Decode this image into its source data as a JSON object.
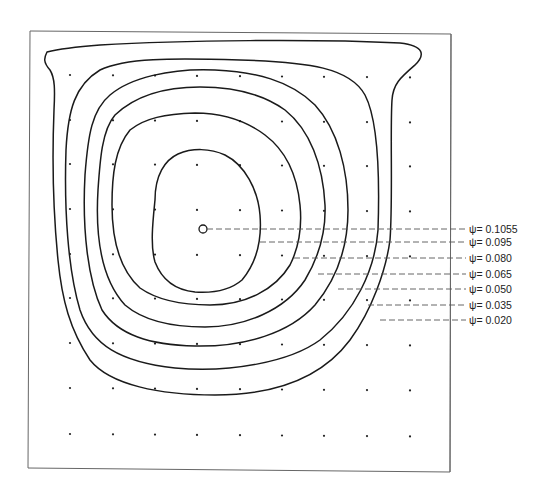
{
  "figure": {
    "type": "streamline contour plot",
    "stroke_color": "#1a1a1a",
    "frame_color": "#555555",
    "background": "#ffffff"
  },
  "center_marker": {
    "x": 203,
    "y": 229,
    "r": 4,
    "label": "vortex center"
  },
  "grid_dots": {
    "columns": [
      70,
      113,
      155,
      197,
      240,
      282,
      324,
      367,
      410
    ],
    "rows": [
      75,
      120,
      164,
      209,
      254,
      298,
      343,
      388,
      434
    ]
  },
  "contours": [
    {
      "psi": "0.1055",
      "label": "ψ= 0.1055",
      "label_y": 232,
      "dash_start": 207
    },
    {
      "psi": "0.095",
      "label": "ψ= 0.095",
      "label_y": 245,
      "dash_start": 260
    },
    {
      "psi": "0.080",
      "label": "ψ= 0.080",
      "label_y": 261,
      "dash_start": 294
    },
    {
      "psi": "0.065",
      "label": "ψ= 0.065",
      "label_y": 277,
      "dash_start": 318
    },
    {
      "psi": "0.050",
      "label": "ψ= 0.050",
      "label_y": 292,
      "dash_start": 338
    },
    {
      "psi": "0.035",
      "label": "ψ= 0.035",
      "label_y": 308,
      "dash_start": 368
    },
    {
      "psi": "0.020",
      "label": "ψ= 0.020",
      "label_y": 323,
      "dash_start": 380
    }
  ]
}
